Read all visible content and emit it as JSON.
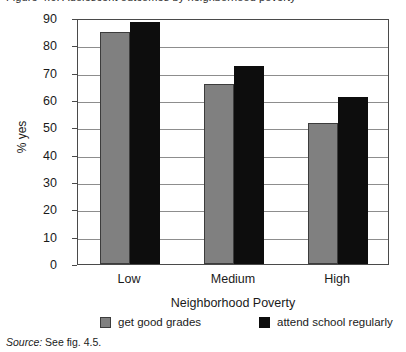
{
  "figure": {
    "title_clipped": "Figure 4.6. Adolescent outcomes by neighborhood poverty",
    "source_label": "Source:",
    "source_text": " See fig. 4.5."
  },
  "chart_data": {
    "type": "bar",
    "title": "",
    "xlabel": "Neighborhood Poverty",
    "ylabel": "% yes",
    "categories": [
      "Low",
      "Medium",
      "High"
    ],
    "series": [
      {
        "name": "get good grades",
        "color": "#808080",
        "values": [
          85,
          66,
          51.5
        ]
      },
      {
        "name": "attend school regularly",
        "color": "#0d0d0d",
        "values": [
          88.5,
          72.5,
          61
        ]
      }
    ],
    "ylim": [
      0,
      90
    ],
    "ytick_step": 10,
    "yticks": [
      "90",
      "80",
      "70",
      "60",
      "50",
      "40",
      "30",
      "20",
      "10",
      "0"
    ],
    "grid": true,
    "legend_position": "bottom"
  }
}
